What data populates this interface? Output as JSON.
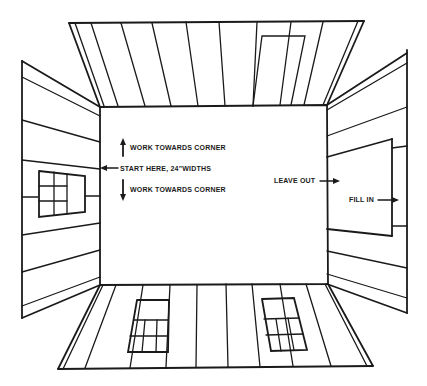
{
  "diagram": {
    "title": "",
    "labels": {
      "work_up": "WORK TOWARDS CORNER",
      "start_here": "START HERE, 24\"WIDTHS",
      "work_down": "WORK TOWARDS CORNER",
      "leave_out": "LEAVE OUT",
      "fill_in": "FILL IN"
    },
    "panels": [
      {
        "name": "ceiling",
        "features": [
          "vertical boards",
          "door outline"
        ]
      },
      {
        "name": "left-wall",
        "features": [
          "horizontal boards",
          "window with 6 panes"
        ]
      },
      {
        "name": "back-wall",
        "features": [
          "blank center"
        ]
      },
      {
        "name": "right-wall",
        "features": [
          "horizontal boards",
          "opening to leave out/fill in"
        ]
      },
      {
        "name": "floor",
        "features": [
          "vertical boards",
          "two windows"
        ]
      }
    ],
    "colors": {
      "ink": "#1a1a1a",
      "paper": "#ffffff"
    }
  }
}
